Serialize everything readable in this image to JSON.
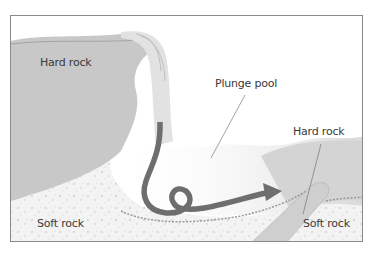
{
  "diagram": {
    "labels": {
      "hard_rock_left": "Hard rock",
      "plunge_pool": "Plunge pool",
      "hard_rock_right": "Hard rock",
      "soft_rock_left": "Soft rock",
      "soft_rock_right": "Soft  rock"
    },
    "colors": {
      "hard_rock": "#c8c8c8",
      "soft_rock": "#f2f2f2",
      "water": "#e6e6e6",
      "arrow": "#6e6e6e",
      "frame": "#8a8a8a",
      "text": "#3a3a3a"
    }
  }
}
